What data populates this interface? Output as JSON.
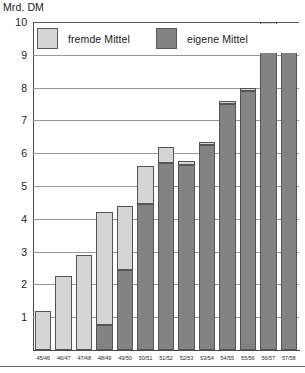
{
  "axis_unit_label": "Mrd. DM",
  "legend": {
    "entries": [
      {
        "label": "fremde Mittel",
        "color": "#d5d5d5",
        "key": "external"
      },
      {
        "label": "eigene Mittel",
        "color": "#838383",
        "key": "own"
      }
    ]
  },
  "y_axis": {
    "ticks": [
      "1",
      "2",
      "3",
      "4",
      "5",
      "6",
      "7",
      "8",
      "9",
      "10"
    ]
  },
  "chart_data": {
    "type": "bar",
    "title": "",
    "subtitle": "",
    "xlabel": "",
    "ylabel": "Mrd. DM",
    "ylim": [
      0,
      10
    ],
    "yticks": [
      1,
      2,
      3,
      4,
      5,
      6,
      7,
      8,
      9,
      10
    ],
    "grid": true,
    "stacked": true,
    "legend_position": "top-inside",
    "categories": [
      "45/46",
      "46/47",
      "47/48",
      "48/49",
      "49/50",
      "50/51",
      "51/52",
      "52/53",
      "53/54",
      "54/55",
      "55/56",
      "56/57",
      "57/58"
    ],
    "series": [
      {
        "name": "eigene Mittel",
        "color": "#838383",
        "values": [
          0,
          0,
          0,
          0.75,
          2.45,
          4.45,
          5.7,
          5.65,
          6.25,
          7.5,
          7.9,
          9.9,
          9.65
        ]
      },
      {
        "name": "fremde Mittel",
        "color": "#d5d5d5",
        "values": [
          1.2,
          2.25,
          2.9,
          3.45,
          1.95,
          1.15,
          0.5,
          0.1,
          0.1,
          0.1,
          0.1,
          0.1,
          0.1
        ]
      }
    ],
    "totals": [
      1.2,
      2.25,
      2.9,
      4.2,
      4.4,
      5.6,
      6.2,
      5.75,
      6.35,
      7.6,
      8.0,
      10.0,
      9.75
    ]
  }
}
